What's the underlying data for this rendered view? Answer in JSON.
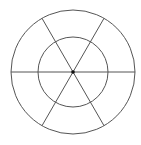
{
  "diagram": {
    "type": "concentric-circles-with-spokes",
    "center": [
      73,
      72
    ],
    "outer_radius": 62,
    "inner_radius": 35,
    "spoke_angles_deg": [
      0,
      60,
      120
    ],
    "stroke_color": "#555555",
    "center_dot_color": "#111111",
    "background": "#ffffff"
  }
}
